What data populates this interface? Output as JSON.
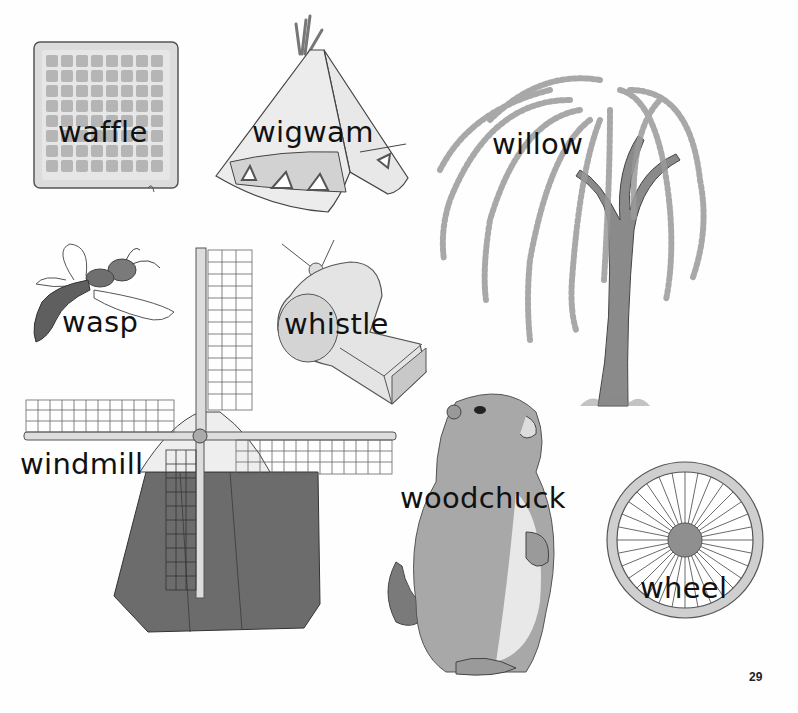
{
  "page": {
    "number": "29",
    "theme_letter": "w",
    "items": [
      {
        "id": "waffle",
        "label": "waffle"
      },
      {
        "id": "wigwam",
        "label": "wigwam"
      },
      {
        "id": "willow",
        "label": "willow"
      },
      {
        "id": "wasp",
        "label": "wasp"
      },
      {
        "id": "whistle",
        "label": "whistle"
      },
      {
        "id": "windmill",
        "label": "windmill"
      },
      {
        "id": "woodchuck",
        "label": "woodchuck"
      },
      {
        "id": "wheel",
        "label": "wheel"
      }
    ]
  },
  "colors": {
    "ink": "#111111",
    "light_gray": "#d9d9d9",
    "mid_gray": "#9a9a9a",
    "dark_gray": "#6a6a6a",
    "paper": "#fefefe"
  }
}
